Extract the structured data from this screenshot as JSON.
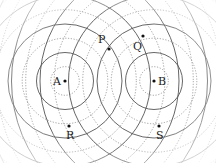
{
  "diagram": {
    "type": "two-source wave interference",
    "sources": [
      {
        "label": "A",
        "x": 65,
        "y": 81
      },
      {
        "label": "B",
        "x": 154,
        "y": 81
      }
    ],
    "wavelength_px": 28.5,
    "crest_style": "solid",
    "trough_style": "dotted",
    "points": [
      {
        "label": "P",
        "x": 109,
        "y": 49,
        "lx": 98,
        "ly": 43
      },
      {
        "label": "Q",
        "x": 143,
        "y": 36,
        "lx": 133,
        "ly": 50
      },
      {
        "label": "R",
        "x": 69,
        "y": 126,
        "lx": 66,
        "ly": 139
      },
      {
        "label": "S",
        "x": 159,
        "y": 126,
        "lx": 156,
        "ly": 139
      }
    ],
    "colors": {
      "crest": "#555555",
      "trough": "#888888",
      "dot": "#111111",
      "text": "#222222"
    }
  }
}
